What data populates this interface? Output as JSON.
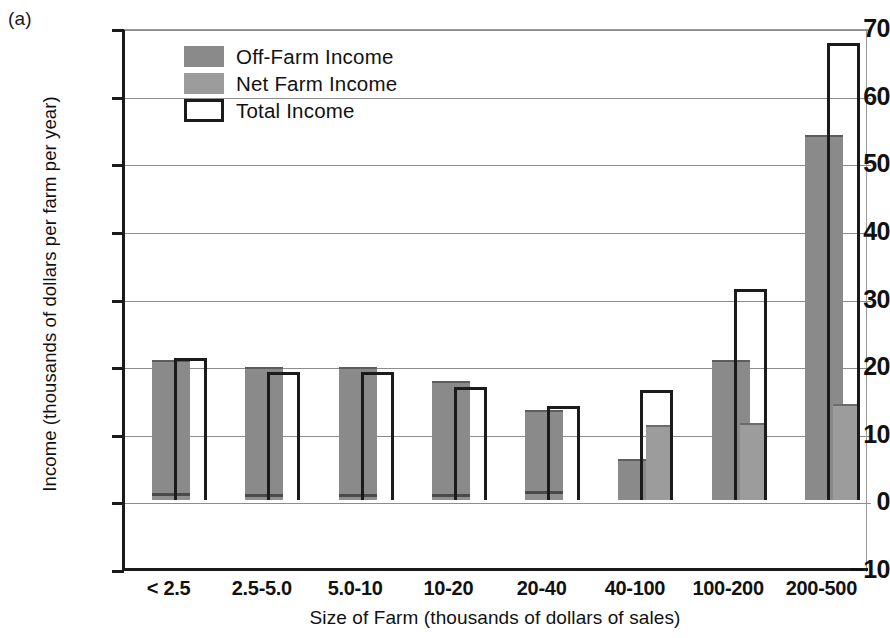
{
  "panel": {
    "label": "(a)"
  },
  "chart_data": {
    "type": "bar",
    "title": "",
    "xlabel": "Size of Farm (thousands of dollars of sales)",
    "ylabel": "Income (thousands of dollars per farm per year)",
    "ylim": [
      -10,
      70
    ],
    "yticks": [
      -10,
      0,
      10,
      20,
      30,
      40,
      50,
      60,
      70
    ],
    "ytick_labels": [
      "−10",
      "0",
      "10",
      "20",
      "30",
      "40",
      "50",
      "60",
      "70"
    ],
    "grid": true,
    "legend_position": "upper left",
    "categories": [
      "< 2.5",
      "2.5-5.0",
      "5.0-10",
      "10-20",
      "20-40",
      "40-100",
      "100-200",
      "200-500"
    ],
    "series": [
      {
        "name": "Off-Farm Income",
        "color": "#8a8a8a",
        "values": [
          20.5,
          19.5,
          19.5,
          17.3,
          13.0,
          5.8,
          20.4,
          53.8
        ]
      },
      {
        "name": "Net Farm Income",
        "color": "#9c9c9c",
        "values": [
          0.6,
          0.5,
          0.5,
          0.5,
          0.9,
          10.8,
          11.2,
          13.9
        ]
      },
      {
        "name": "Total Income",
        "color": "#ffffff",
        "values": [
          21.0,
          19.0,
          19.0,
          16.8,
          13.9,
          16.3,
          31.3,
          67.6
        ]
      }
    ]
  },
  "legend": {
    "items": [
      {
        "label": "Off-Farm Income",
        "swatch": "off-farm-swatch"
      },
      {
        "label": "Net Farm Income",
        "swatch": "net-farm-swatch"
      },
      {
        "label": "Total Income",
        "swatch": "total-income-swatch"
      }
    ]
  },
  "colors": {
    "off_farm": "#8a8a8a",
    "net_farm": "#9c9c9c",
    "total_outline": "#1b1b1b",
    "grid": "#8d8d8d",
    "axis": "#1b1b1b"
  }
}
